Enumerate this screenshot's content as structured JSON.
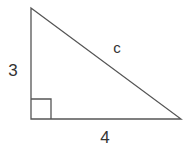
{
  "diagram": {
    "type": "right-triangle",
    "labels": {
      "vertical_leg": "3",
      "horizontal_leg": "4",
      "hypotenuse": "c"
    },
    "colors": {
      "stroke": "#555555",
      "text": "#333333",
      "background": "#ffffff"
    }
  }
}
